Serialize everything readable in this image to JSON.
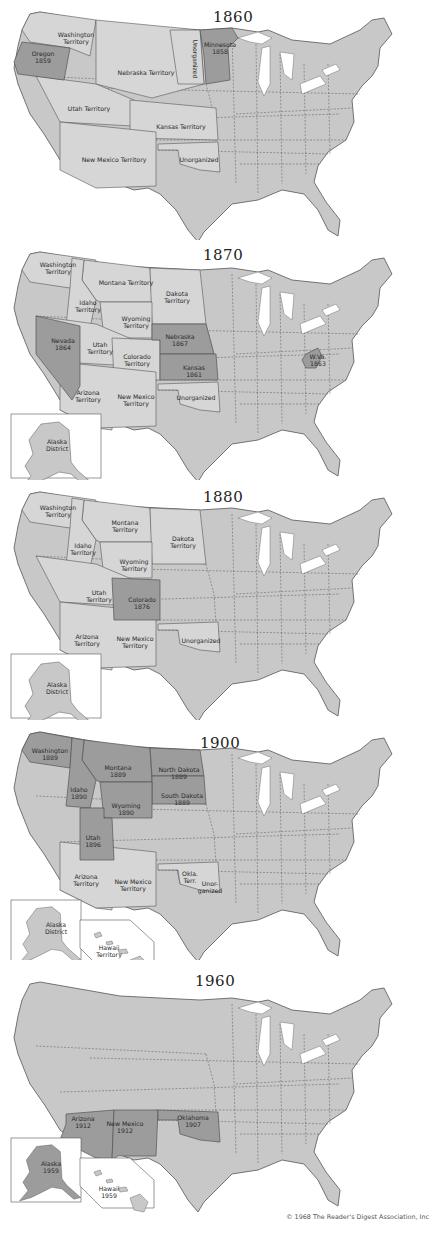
{
  "colors": {
    "base": "#c8c8c8",
    "territory": "#d6d6d6",
    "new_state": "#9c9c9c",
    "border": "#555555",
    "lake": "#ffffff",
    "background": "#ffffff"
  },
  "panels": [
    {
      "year": "1860",
      "top": 0,
      "year_pos": [
        213,
        8
      ],
      "highlighted": [
        "oregon",
        "minnesota"
      ],
      "territories": [
        "washington_terr",
        "nebraska_terr",
        "unorg_dakota",
        "utah_terr",
        "kansas_terr",
        "newmexico_terr",
        "unorg_ok"
      ],
      "labels": [
        {
          "text": "Washington\nTerritory",
          "x": 76,
          "y": 34
        },
        {
          "text": "Oregon\n1859",
          "x": 43,
          "y": 53
        },
        {
          "text": "Nebraska Territory",
          "x": 146,
          "y": 68
        },
        {
          "text": "Unorganized",
          "x": 195,
          "y": 55,
          "rotate": 90
        },
        {
          "text": "Minnesota\n1858",
          "x": 220,
          "y": 44
        },
        {
          "text": "Utah Territory",
          "x": 89,
          "y": 104
        },
        {
          "text": "Kansas Territory",
          "x": 181,
          "y": 122
        },
        {
          "text": "New Mexico Territory",
          "x": 114,
          "y": 155
        },
        {
          "text": "Unorganized",
          "x": 199,
          "y": 155
        }
      ],
      "insets": []
    },
    {
      "year": "1870",
      "top": 240,
      "year_pos": [
        203,
        6
      ],
      "highlighted": [
        "nevada",
        "nebraska",
        "kansas",
        "wva"
      ],
      "territories": [
        "washington_terr",
        "montana_terr",
        "dakota_terr",
        "idaho_terr",
        "wyoming_terr",
        "utah_terr",
        "colorado_terr",
        "arizona_terr",
        "newmexico_terr",
        "unorg_ok"
      ],
      "labels": [
        {
          "text": "Washington\nTerritory",
          "x": 58,
          "y": 24
        },
        {
          "text": "Montana Territory",
          "x": 126,
          "y": 38
        },
        {
          "text": "Dakota\nTerritory",
          "x": 177,
          "y": 53
        },
        {
          "text": "Idaho\nTerritory",
          "x": 88,
          "y": 62
        },
        {
          "text": "Wyoming\nTerritory",
          "x": 136,
          "y": 78
        },
        {
          "text": "Nevada\n1864",
          "x": 63,
          "y": 100
        },
        {
          "text": "Utah\nTerritory",
          "x": 100,
          "y": 104
        },
        {
          "text": "Nebraska\n1867",
          "x": 180,
          "y": 96
        },
        {
          "text": "Colorado\nTerritory",
          "x": 137,
          "y": 116
        },
        {
          "text": "Kansas\n1861",
          "x": 194,
          "y": 127
        },
        {
          "text": "W.Va.\n1863",
          "x": 318,
          "y": 116
        },
        {
          "text": "Arizona\nTerritory",
          "x": 88,
          "y": 152
        },
        {
          "text": "New Mexico\nTerritory",
          "x": 136,
          "y": 156
        },
        {
          "text": "Unorganized",
          "x": 196,
          "y": 153
        }
      ],
      "insets": [
        {
          "name": "alaska",
          "label": "Alaska\nDistrict",
          "highlight": false
        }
      ]
    },
    {
      "year": "1880",
      "top": 480,
      "year_pos": [
        203,
        8
      ],
      "highlighted": [
        "colorado"
      ],
      "territories": [
        "washington_terr",
        "montana_terr",
        "dakota_terr",
        "idaho_terr",
        "wyoming_terr",
        "utah_terr",
        "arizona_terr",
        "newmexico_terr",
        "unorg_ok"
      ],
      "labels": [
        {
          "text": "Washington\nTerritory",
          "x": 58,
          "y": 27
        },
        {
          "text": "Montana\nTerritory",
          "x": 125,
          "y": 42
        },
        {
          "text": "Dakota\nTerritory",
          "x": 183,
          "y": 58
        },
        {
          "text": "Idaho\nTerritory",
          "x": 83,
          "y": 65
        },
        {
          "text": "Wyoming\nTerritory",
          "x": 134,
          "y": 81
        },
        {
          "text": "Utah\nTerritory",
          "x": 99,
          "y": 112
        },
        {
          "text": "Colorado\n1876",
          "x": 142,
          "y": 119
        },
        {
          "text": "Arizona\nTerritory",
          "x": 87,
          "y": 156
        },
        {
          "text": "New Mexico\nTerritory",
          "x": 135,
          "y": 158
        },
        {
          "text": "Unorganized",
          "x": 201,
          "y": 156
        }
      ],
      "insets": [
        {
          "name": "alaska",
          "label": "Alaska\nDistrict",
          "highlight": false
        }
      ]
    },
    {
      "year": "1900",
      "top": 720,
      "year_pos": [
        200,
        14
      ],
      "highlighted": [
        "washington",
        "montana",
        "northdakota",
        "idaho",
        "southdakota",
        "wyoming",
        "utah"
      ],
      "territories": [
        "arizona_terr",
        "newmexico_terr",
        "okla_terr",
        "unorg_ok"
      ],
      "labels": [
        {
          "text": "Washington\n1889",
          "x": 50,
          "y": 30
        },
        {
          "text": "Montana\n1889",
          "x": 118,
          "y": 47
        },
        {
          "text": "North Dakota\n1889",
          "x": 179,
          "y": 49
        },
        {
          "text": "Idaho\n1890",
          "x": 79,
          "y": 69
        },
        {
          "text": "South Dakota\n1889",
          "x": 182,
          "y": 75
        },
        {
          "text": "Wyoming\n1890",
          "x": 126,
          "y": 85
        },
        {
          "text": "Utah\n1896",
          "x": 93,
          "y": 117
        },
        {
          "text": "Arizona\nTerritory",
          "x": 86,
          "y": 156
        },
        {
          "text": "New Mexico\nTerritory",
          "x": 133,
          "y": 161
        },
        {
          "text": "Okla.\nTerr.",
          "x": 190,
          "y": 153
        },
        {
          "text": "Unor-\nganized",
          "x": 210,
          "y": 163
        }
      ],
      "insets": [
        {
          "name": "alaska",
          "label": "Alaska\nDistrict",
          "highlight": false
        },
        {
          "name": "hawaii",
          "label": "Hawaii\nTerritory",
          "highlight": false
        }
      ]
    },
    {
      "year": "1960",
      "top": 970,
      "year_pos": [
        195,
        2
      ],
      "highlighted": [
        "arizona",
        "newmexico",
        "oklahoma"
      ],
      "territories": [],
      "labels": [
        {
          "text": "Arizona\n1912",
          "x": 83,
          "y": 148
        },
        {
          "text": "New Mexico\n1912",
          "x": 125,
          "y": 153
        },
        {
          "text": "Oklahoma\n1907",
          "x": 193,
          "y": 147
        },
        {
          "text": "Alaska\n1959",
          "x": 51,
          "y": 193
        },
        {
          "text": "Hawaii\n1959",
          "x": 109,
          "y": 218
        }
      ],
      "insets": [
        {
          "name": "alaska",
          "label": "",
          "highlight": true
        },
        {
          "name": "hawaii",
          "label": "",
          "highlight": false
        }
      ]
    }
  ],
  "copyright": "© 1968 The Reader's Digest Association, Inc"
}
